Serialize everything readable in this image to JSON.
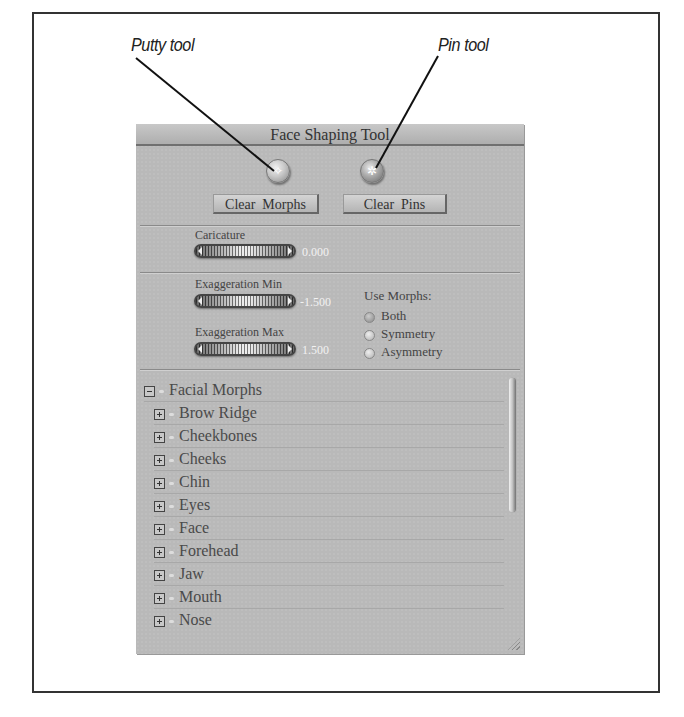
{
  "callouts": {
    "putty": "Putty tool",
    "pin": "Pin tool"
  },
  "panel": {
    "title": "Face Shaping Tool",
    "tools": [
      {
        "name": "putty-tool",
        "icon": "putty-icon",
        "glyph": "✧"
      },
      {
        "name": "pin-tool",
        "icon": "pin-icon",
        "glyph": "✲"
      }
    ],
    "buttons": {
      "clear_morphs": "Clear  Morphs",
      "clear_pins": "Clear  Pins"
    },
    "caricature": {
      "label": "Caricature",
      "value": "0.000"
    },
    "exaggeration_min": {
      "label": "Exaggeration Min",
      "value": "-1.500"
    },
    "exaggeration_max": {
      "label": "Exaggeration Max",
      "value": "1.500"
    },
    "use_morphs": {
      "label": "Use Morphs:",
      "options": [
        "Both",
        "Symmetry",
        "Asymmetry"
      ],
      "selected": "Both"
    },
    "tree": {
      "root": "Facial Morphs",
      "items": [
        "Brow Ridge",
        "Cheekbones",
        "Cheeks",
        "Chin",
        "Eyes",
        "Face",
        "Forehead",
        "Jaw",
        "Mouth",
        "Nose"
      ]
    }
  }
}
